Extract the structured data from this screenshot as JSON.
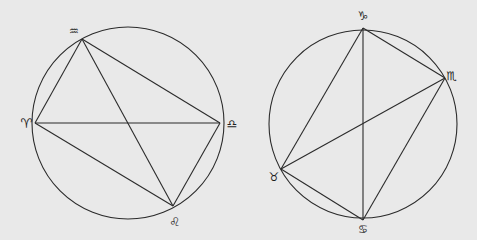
{
  "colors": {
    "background": "#e9e9e9",
    "line": "#2b2b2b",
    "glyph": "#1f1f1f"
  },
  "figures": [
    {
      "id": "left",
      "points": {
        "aquarius": {
          "symbol": "♒",
          "name": "Aquarius"
        },
        "aries": {
          "symbol": "♈",
          "name": "Aries"
        },
        "libra": {
          "symbol": "♎",
          "name": "Libra"
        },
        "leo": {
          "symbol": "♌",
          "name": "Leo"
        }
      },
      "chords": [
        [
          "aquarius",
          "aries"
        ],
        [
          "aquarius",
          "libra"
        ],
        [
          "aquarius",
          "leo"
        ],
        [
          "aries",
          "libra"
        ],
        [
          "aries",
          "leo"
        ],
        [
          "libra",
          "leo"
        ]
      ]
    },
    {
      "id": "right",
      "points": {
        "capricorn": {
          "symbol": "♑",
          "name": "Capricorn"
        },
        "scorpio": {
          "symbol": "♏",
          "name": "Scorpio"
        },
        "taurus": {
          "symbol": "♉",
          "name": "Taurus"
        },
        "cancer": {
          "symbol": "♋",
          "name": "Cancer"
        }
      },
      "chords": [
        [
          "capricorn",
          "taurus"
        ],
        [
          "capricorn",
          "cancer"
        ],
        [
          "capricorn",
          "scorpio"
        ],
        [
          "scorpio",
          "taurus"
        ],
        [
          "scorpio",
          "cancer"
        ],
        [
          "taurus",
          "cancer"
        ]
      ]
    }
  ]
}
